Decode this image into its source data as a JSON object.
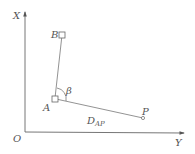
{
  "diagram": {
    "type": "surveying-polar-coordinates",
    "colors": {
      "line": "#777777",
      "axis": "#666666",
      "text": "#555555",
      "background": "#ffffff"
    },
    "axes": {
      "origin_label": "O",
      "vertical_label": "X",
      "horizontal_label": "Y"
    },
    "points": {
      "B": {
        "label": "B",
        "marker": "square"
      },
      "A": {
        "label": "A",
        "marker": "square"
      },
      "P": {
        "label": "P",
        "marker": "circle"
      }
    },
    "angle": {
      "label": "β",
      "between": [
        "AB",
        "AP"
      ]
    },
    "distance": {
      "label_main": "D",
      "label_sub": "AP"
    }
  }
}
